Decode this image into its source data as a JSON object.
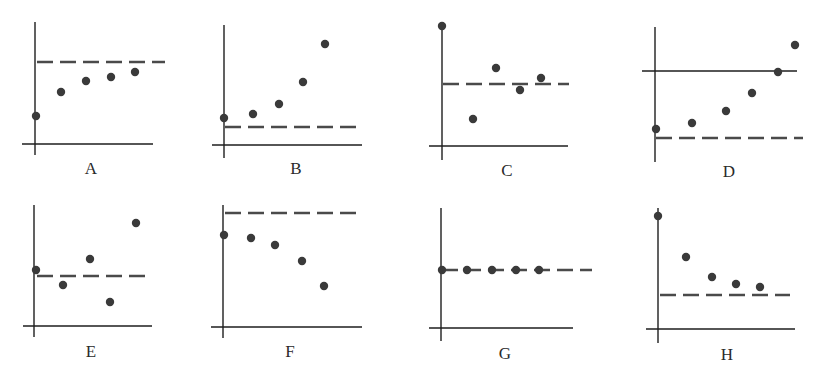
{
  "figure": {
    "width": 824,
    "height": 385,
    "ink_color": "#1e1e1e",
    "dot_color": "#3a3a3a",
    "dash_color": "#4a4a4a"
  },
  "chart_data": [
    {
      "type": "scatter",
      "title": "A",
      "description": "Points rise toward and approach a horizontal dashed asymptote from below",
      "axes": {
        "origin": [
          35,
          144
        ],
        "y_top": 22,
        "y_bottom": 155,
        "x_left": 22,
        "x_right": 153,
        "solid_hline": null
      },
      "dashed_line": {
        "y": 62,
        "x1": 37,
        "x2": 165
      },
      "points": [
        [
          36,
          116
        ],
        [
          61,
          92
        ],
        [
          86,
          81
        ],
        [
          111,
          77
        ],
        [
          135,
          72
        ]
      ]
    },
    {
      "type": "scatter",
      "title": "B",
      "description": "Points increase away from a dashed line below them",
      "axes": {
        "origin": [
          224,
          145
        ],
        "y_top": 25,
        "y_bottom": 158,
        "x_left": 212,
        "x_right": 362,
        "solid_hline": null
      },
      "dashed_line": {
        "y": 127,
        "x1": 225,
        "x2": 356
      },
      "points": [
        [
          224,
          118
        ],
        [
          253,
          114
        ],
        [
          279,
          104
        ],
        [
          303,
          82
        ],
        [
          325,
          44
        ]
      ]
    },
    {
      "type": "scatter",
      "title": "C",
      "description": "Points oscillate around a dashed line",
      "axes": {
        "origin": [
          442,
          146
        ],
        "y_top": 26,
        "y_bottom": 160,
        "x_left": 429,
        "x_right": 568,
        "solid_hline": null
      },
      "dashed_line": {
        "y": 84,
        "x1": 443,
        "x2": 569
      },
      "points": [
        [
          442,
          26
        ],
        [
          473,
          119
        ],
        [
          496,
          68
        ],
        [
          520,
          90
        ],
        [
          541,
          78
        ]
      ]
    },
    {
      "type": "scatter",
      "title": "D",
      "description": "Points increase away from dashed line, crossing a solid horizontal line",
      "axes": {
        "origin": [
          655,
          162
        ],
        "y_top": 27,
        "y_bottom": 162,
        "x_left": 642,
        "x_right": 797,
        "solid_hline": {
          "y": 71,
          "x1": 642,
          "x2": 797
        }
      },
      "dashed_line": {
        "y": 138,
        "x1": 656,
        "x2": 803
      },
      "points": [
        [
          656,
          129
        ],
        [
          692,
          123
        ],
        [
          726,
          111
        ],
        [
          752,
          93
        ],
        [
          778,
          72
        ],
        [
          795,
          45
        ]
      ]
    },
    {
      "type": "scatter",
      "title": "E",
      "description": "Points oscillate with growing amplitude around a dashed line",
      "axes": {
        "origin": [
          34,
          326
        ],
        "y_top": 205,
        "y_bottom": 337,
        "x_left": 23,
        "x_right": 152,
        "solid_hline": null
      },
      "dashed_line": {
        "y": 276,
        "x1": 37,
        "x2": 151
      },
      "points": [
        [
          36,
          270
        ],
        [
          63,
          285
        ],
        [
          90,
          259
        ],
        [
          110,
          302
        ],
        [
          136,
          223
        ]
      ]
    },
    {
      "type": "scatter",
      "title": "F",
      "description": "Points decrease away from a dashed line above them",
      "axes": {
        "origin": [
          223,
          327
        ],
        "y_top": 205,
        "y_bottom": 338,
        "x_left": 211,
        "x_right": 362,
        "solid_hline": null
      },
      "dashed_line": {
        "y": 213,
        "x1": 225,
        "x2": 357
      },
      "points": [
        [
          224,
          235
        ],
        [
          251,
          238
        ],
        [
          275,
          245
        ],
        [
          302,
          261
        ],
        [
          324,
          286
        ]
      ]
    },
    {
      "type": "scatter",
      "title": "G",
      "description": "All points lie on the dashed line (constant)",
      "axes": {
        "origin": [
          441,
          328
        ],
        "y_top": 208,
        "y_bottom": 341,
        "x_left": 429,
        "x_right": 573,
        "solid_hline": null
      },
      "dashed_line": {
        "y": 270,
        "x1": 442,
        "x2": 592
      },
      "points": [
        [
          442,
          270
        ],
        [
          467,
          270
        ],
        [
          492,
          270
        ],
        [
          516,
          270
        ],
        [
          539,
          270
        ]
      ]
    },
    {
      "type": "scatter",
      "title": "H",
      "description": "Points decrease toward a dashed asymptote from above",
      "axes": {
        "origin": [
          658,
          329
        ],
        "y_top": 208,
        "y_bottom": 343,
        "x_left": 646,
        "x_right": 795,
        "solid_hline": null
      },
      "dashed_line": {
        "y": 295,
        "x1": 660,
        "x2": 790
      },
      "points": [
        [
          658,
          216
        ],
        [
          686,
          257
        ],
        [
          712,
          277
        ],
        [
          736,
          284
        ],
        [
          760,
          287
        ]
      ]
    }
  ],
  "labels": {
    "A": "A",
    "B": "B",
    "C": "C",
    "D": "D",
    "E": "E",
    "F": "F",
    "G": "G",
    "H": "H"
  },
  "label_positions": {
    "A": [
      91,
      174
    ],
    "B": [
      296,
      174
    ],
    "C": [
      507,
      176
    ],
    "D": [
      729,
      177
    ],
    "E": [
      91,
      357
    ],
    "F": [
      290,
      357
    ],
    "G": [
      505,
      359
    ],
    "H": [
      727,
      360
    ]
  }
}
